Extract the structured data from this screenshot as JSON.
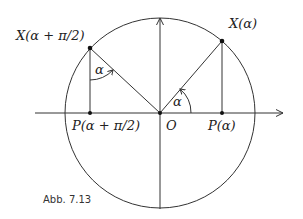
{
  "figure": {
    "caption": "Abb. 7.13",
    "colors": {
      "line": "#333333",
      "text": "#222222",
      "background": "#ffffff"
    }
  },
  "geometry": {
    "origin": {
      "x": 160,
      "y": 113
    },
    "radius": 95,
    "x_axis": {
      "x1": 35,
      "x2": 283
    },
    "y_axis": {
      "y1": 209,
      "y2": 17
    }
  },
  "points": {
    "X_alpha": {
      "label": "X(α)",
      "x": 222,
      "y": 41
    },
    "X_alpha_pi2": {
      "label": "X(α + π/2)",
      "x": 90,
      "y": 48
    },
    "P_alpha": {
      "label": "P(α)",
      "x": 222,
      "y": 113
    },
    "P_alpha_pi2": {
      "label": "P(α + π/2)",
      "x": 90,
      "y": 113
    },
    "O": {
      "label": "O",
      "x": 160,
      "y": 113
    }
  },
  "labels": {
    "X_alpha": "X(α)",
    "X_alpha_pi2": "X(α + π/2)",
    "P_alpha": "P(α)",
    "P_alpha_pi2": "P(α + π/2)",
    "origin": "O",
    "angle_at_origin": "α",
    "angle_at_X_alpha_pi2": "α"
  }
}
